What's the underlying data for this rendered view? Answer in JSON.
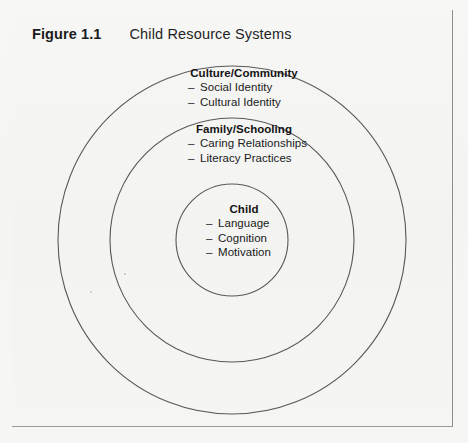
{
  "figure": {
    "label": "Figure 1.1",
    "title": "Child Resource Systems"
  },
  "diagram": {
    "type": "concentric-circles",
    "stroke_color": "#555555",
    "background_color": "#f4f4f3",
    "rings": [
      {
        "id": "outer",
        "heading": "Culture/Community",
        "items": [
          "Social Identity",
          "Cultural Identity"
        ],
        "radius": 174
      },
      {
        "id": "middle",
        "heading": "Family/Schooling",
        "items": [
          "Caring Relationships",
          "Literacy Practices"
        ],
        "radius": 122
      },
      {
        "id": "inner",
        "heading": "Child",
        "items": [
          "Language",
          "Cognition",
          "Motivation"
        ],
        "radius": 56
      }
    ]
  },
  "bullet": "–",
  "ghost_lines": [
    "the nature of the language and literacy",
    "resources that children bring with them",
    "to the classroom and the ways that",
    "teachers can build upon those resources",
    "in designing instruction for all learners"
  ]
}
